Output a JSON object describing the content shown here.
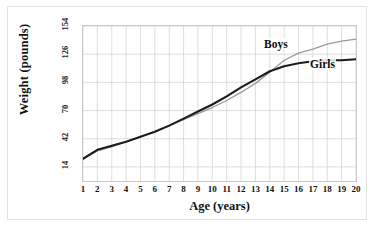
{
  "chart_data": {
    "type": "line",
    "title": "",
    "xlabel": "Age (years)",
    "ylabel": "Weight (pounds)",
    "xlim": [
      1,
      20
    ],
    "ylim": [
      0,
      154
    ],
    "grid": true,
    "legend_position": "inline-annotation",
    "x": [
      1,
      2,
      3,
      4,
      5,
      6,
      7,
      8,
      9,
      10,
      11,
      12,
      13,
      14,
      15,
      16,
      17,
      18,
      19,
      20
    ],
    "xticklabels": [
      "1",
      "2",
      "3",
      "4",
      "5",
      "6",
      "7",
      "8",
      "9",
      "10",
      "11",
      "12",
      "13",
      "14",
      "15",
      "16",
      "17",
      "18",
      "19",
      "20"
    ],
    "yticks": [
      14,
      42,
      70,
      98,
      126,
      154
    ],
    "yticklabels": [
      "14",
      "42",
      "70",
      "98",
      "126",
      "154"
    ],
    "series": [
      {
        "name": "Boys",
        "color": "#9a9a9a",
        "width": 1.3,
        "values": [
          22,
          30,
          34,
          39,
          44,
          49,
          55,
          61,
          67,
          73,
          80,
          88,
          97,
          108,
          120,
          127,
          131,
          136,
          139,
          141
        ]
      },
      {
        "name": "Girls",
        "color": "#1c1c1c",
        "width": 2.1,
        "values": [
          22,
          31,
          35,
          39,
          44,
          49,
          55,
          62,
          69,
          76,
          84,
          93,
          101,
          109,
          114,
          117,
          119,
          120,
          120,
          121
        ]
      }
    ],
    "annotations": [
      {
        "text": "Boys",
        "x": 15,
        "y": 128
      },
      {
        "text": "Girls",
        "x": 18,
        "y": 112
      }
    ]
  },
  "axes": {
    "y_title": "Weight (pounds)",
    "x_title": "Age (years)"
  },
  "colors": {
    "boys_line": "#9a9a9a",
    "girls_line": "#1c1c1c",
    "grid": "#d6d6d6",
    "plot_border": "#c9c9c9",
    "frame_border": "#e2e2e2",
    "background": "#ffffff",
    "text": "#121212"
  }
}
